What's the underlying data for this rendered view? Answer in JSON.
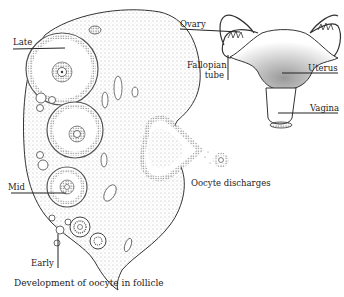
{
  "ovary_diagram": {
    "labels": {
      "late": "Late",
      "mid": "Mid",
      "early": "Early",
      "oocyte_discharges": "Oocyte discharges"
    },
    "caption": "Development of oocyte in follicle"
  },
  "reproductive_diagram": {
    "labels": {
      "ovary": "Ovary",
      "fallopian_tube_line1": "Fallopian",
      "fallopian_tube_line2": "tube",
      "uterus": "Uterus",
      "vagina": "Vagina"
    }
  },
  "colors": {
    "line": "#333333",
    "stipple": "#777777",
    "background": "#ffffff"
  }
}
